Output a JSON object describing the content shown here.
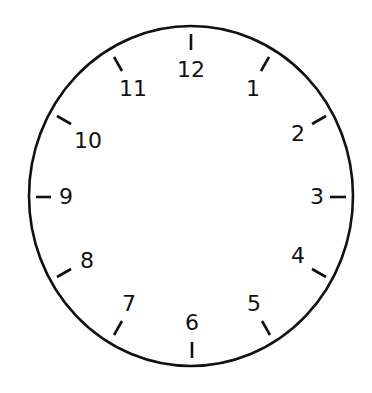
{
  "clock": {
    "title": "Clock face",
    "stroke_color": "#111111",
    "background": "#ffffff",
    "face": {
      "cx": 191,
      "cy": 196,
      "rx": 162,
      "ry": 170,
      "stroke_width": 2.6
    },
    "numerals": [
      {
        "label": "12",
        "x": 191,
        "y": 70
      },
      {
        "label": "1",
        "x": 253,
        "y": 89
      },
      {
        "label": "2",
        "x": 298,
        "y": 134
      },
      {
        "label": "3",
        "x": 317,
        "y": 197
      },
      {
        "label": "4",
        "x": 298,
        "y": 256
      },
      {
        "label": "5",
        "x": 254,
        "y": 304
      },
      {
        "label": "6",
        "x": 192,
        "y": 323
      },
      {
        "label": "7",
        "x": 129,
        "y": 304
      },
      {
        "label": "8",
        "x": 87,
        "y": 261
      },
      {
        "label": "9",
        "x": 66,
        "y": 197
      },
      {
        "label": "10",
        "x": 88,
        "y": 141
      },
      {
        "label": "11",
        "x": 133,
        "y": 89
      }
    ],
    "ticks": [
      {
        "hour": 12,
        "x1": 191,
        "y1": 34,
        "x2": 191,
        "y2": 50
      },
      {
        "hour": 1,
        "x1": 269,
        "y1": 57,
        "x2": 261,
        "y2": 71
      },
      {
        "hour": 2,
        "x1": 326,
        "y1": 116,
        "x2": 312,
        "y2": 124
      },
      {
        "hour": 3,
        "x1": 346,
        "y1": 197,
        "x2": 330,
        "y2": 197
      },
      {
        "hour": 4,
        "x1": 326,
        "y1": 277,
        "x2": 312,
        "y2": 269
      },
      {
        "hour": 5,
        "x1": 270,
        "y1": 335,
        "x2": 262,
        "y2": 321
      },
      {
        "hour": 6,
        "x1": 192,
        "y1": 358,
        "x2": 192,
        "y2": 342
      },
      {
        "hour": 7,
        "x1": 114,
        "y1": 335,
        "x2": 122,
        "y2": 321
      },
      {
        "hour": 8,
        "x1": 57,
        "y1": 277,
        "x2": 71,
        "y2": 269
      },
      {
        "hour": 9,
        "x1": 36,
        "y1": 197,
        "x2": 51,
        "y2": 197
      },
      {
        "hour": 10,
        "x1": 57,
        "y1": 116,
        "x2": 71,
        "y2": 124
      },
      {
        "hour": 11,
        "x1": 114,
        "y1": 57,
        "x2": 122,
        "y2": 71
      }
    ],
    "tick_stroke_width": 2.6
  }
}
